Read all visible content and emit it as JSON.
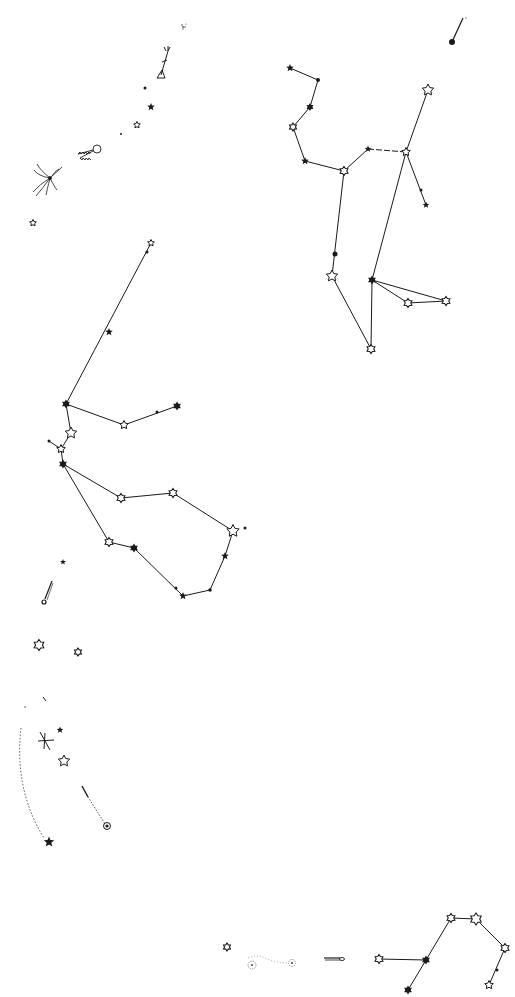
{
  "diagram": {
    "type": "star-chart",
    "background": "#ffffff",
    "ink": "#1a1a1a",
    "width": 515,
    "height": 997
  },
  "stars": [
    {
      "id": "s1",
      "x": 452,
      "y": 42,
      "kind": "dot",
      "r": 3
    },
    {
      "id": "s2",
      "x": 290,
      "y": 68,
      "kind": "star-filled",
      "r": 4
    },
    {
      "id": "s3",
      "x": 318,
      "y": 80,
      "kind": "dot",
      "r": 2
    },
    {
      "id": "s4",
      "x": 310,
      "y": 107,
      "kind": "hex-filled",
      "r": 4
    },
    {
      "id": "s5",
      "x": 293,
      "y": 127,
      "kind": "hex-open",
      "r": 4
    },
    {
      "id": "s6",
      "x": 305,
      "y": 161,
      "kind": "star-filled",
      "r": 4
    },
    {
      "id": "s7",
      "x": 344,
      "y": 171,
      "kind": "hex-open",
      "r": 4.5
    },
    {
      "id": "s8",
      "x": 368,
      "y": 149,
      "kind": "star-filled",
      "r": 3.5
    },
    {
      "id": "s9",
      "x": 406,
      "y": 152,
      "kind": "star-open",
      "r": 4.5
    },
    {
      "id": "s10",
      "x": 428,
      "y": 90,
      "kind": "star-open",
      "r": 6
    },
    {
      "id": "s11",
      "x": 421,
      "y": 190,
      "kind": "dot",
      "r": 1.5
    },
    {
      "id": "s12",
      "x": 426,
      "y": 205,
      "kind": "star-filled",
      "r": 3.5
    },
    {
      "id": "s13",
      "x": 335,
      "y": 254,
      "kind": "dot",
      "r": 2.5
    },
    {
      "id": "s14",
      "x": 332,
      "y": 276,
      "kind": "star-open",
      "r": 6
    },
    {
      "id": "s15",
      "x": 372,
      "y": 280,
      "kind": "hex-filled",
      "r": 4.5
    },
    {
      "id": "s16",
      "x": 408,
      "y": 303,
      "kind": "hex-open",
      "r": 4.5
    },
    {
      "id": "s17",
      "x": 446,
      "y": 301,
      "kind": "hex-open",
      "r": 4.5
    },
    {
      "id": "s18",
      "x": 371,
      "y": 349,
      "kind": "hex-open",
      "r": 4.5
    },
    {
      "id": "s19",
      "x": 151,
      "y": 243,
      "kind": "star-open",
      "r": 3.5
    },
    {
      "id": "s20",
      "x": 147,
      "y": 252,
      "kind": "dot",
      "r": 1.5
    },
    {
      "id": "s21",
      "x": 109,
      "y": 332,
      "kind": "star-filled",
      "r": 4
    },
    {
      "id": "s22",
      "x": 66,
      "y": 404,
      "kind": "hex-filled",
      "r": 4.5
    },
    {
      "id": "s23",
      "x": 124,
      "y": 425,
      "kind": "star-open",
      "r": 4.5
    },
    {
      "id": "s24",
      "x": 157,
      "y": 412,
      "kind": "dot",
      "r": 1.5
    },
    {
      "id": "s25",
      "x": 177,
      "y": 406,
      "kind": "hex-filled",
      "r": 4.5
    },
    {
      "id": "s26",
      "x": 71,
      "y": 433,
      "kind": "star-open",
      "r": 6
    },
    {
      "id": "s27",
      "x": 49,
      "y": 441,
      "kind": "dot",
      "r": 1.5
    },
    {
      "id": "s28",
      "x": 61,
      "y": 449,
      "kind": "star-open",
      "r": 4.5
    },
    {
      "id": "s29",
      "x": 63,
      "y": 464,
      "kind": "hex-filled",
      "r": 4.5
    },
    {
      "id": "s30",
      "x": 121,
      "y": 498,
      "kind": "hex-open",
      "r": 4.5
    },
    {
      "id": "s31",
      "x": 173,
      "y": 493,
      "kind": "hex-open",
      "r": 4.5
    },
    {
      "id": "s32",
      "x": 233,
      "y": 531,
      "kind": "star-open",
      "r": 6.5
    },
    {
      "id": "s33",
      "x": 245,
      "y": 528,
      "kind": "dot",
      "r": 1.5
    },
    {
      "id": "s34",
      "x": 225,
      "y": 556,
      "kind": "star-filled",
      "r": 4
    },
    {
      "id": "s35",
      "x": 210,
      "y": 590,
      "kind": "dot",
      "r": 1.8
    },
    {
      "id": "s36",
      "x": 183,
      "y": 596,
      "kind": "star-filled",
      "r": 4
    },
    {
      "id": "s37",
      "x": 176,
      "y": 588,
      "kind": "dot",
      "r": 1.5
    },
    {
      "id": "s38",
      "x": 134,
      "y": 548,
      "kind": "hex-filled",
      "r": 4.5
    },
    {
      "id": "s39",
      "x": 109,
      "y": 542,
      "kind": "hex-open",
      "r": 4.5
    },
    {
      "id": "s40",
      "x": 63,
      "y": 562,
      "kind": "star-filled",
      "r": 3
    },
    {
      "id": "s41",
      "x": 183,
      "y": 27,
      "kind": "cluster",
      "r": 3
    },
    {
      "id": "s42",
      "x": 145,
      "y": 88,
      "kind": "dot",
      "r": 1.5
    },
    {
      "id": "s43",
      "x": 151,
      "y": 107,
      "kind": "star-filled",
      "r": 4
    },
    {
      "id": "s44",
      "x": 137,
      "y": 125,
      "kind": "star-open",
      "r": 3.5
    },
    {
      "id": "s45",
      "x": 121,
      "y": 134,
      "kind": "dot",
      "r": 1
    },
    {
      "id": "s46",
      "x": 33,
      "y": 223,
      "kind": "star-open",
      "r": 3.5
    },
    {
      "id": "s47",
      "x": 39,
      "y": 645,
      "kind": "hex-open",
      "r": 5.5
    },
    {
      "id": "s48",
      "x": 78,
      "y": 652,
      "kind": "hex-open",
      "r": 4
    },
    {
      "id": "s49",
      "x": 60,
      "y": 730,
      "kind": "star-filled",
      "r": 3.5
    },
    {
      "id": "s50",
      "x": 64,
      "y": 761,
      "kind": "star-open",
      "r": 6
    },
    {
      "id": "s51",
      "x": 49,
      "y": 842,
      "kind": "star-filled",
      "r": 5.5
    },
    {
      "id": "s52",
      "x": 107,
      "y": 826,
      "kind": "spiral",
      "r": 3.5
    },
    {
      "id": "s53",
      "x": 227,
      "y": 947,
      "kind": "hex-open",
      "r": 4
    },
    {
      "id": "s54",
      "x": 252,
      "y": 965,
      "kind": "nebula",
      "r": 4
    },
    {
      "id": "s55",
      "x": 292,
      "y": 963,
      "kind": "nebula",
      "r": 3.5
    },
    {
      "id": "s56",
      "x": 379,
      "y": 959,
      "kind": "hex-open",
      "r": 4.5
    },
    {
      "id": "s57",
      "x": 426,
      "y": 960,
      "kind": "hex-filled",
      "r": 4.5
    },
    {
      "id": "s58",
      "x": 408,
      "y": 990,
      "kind": "hex-filled",
      "r": 4.5
    },
    {
      "id": "s59",
      "x": 451,
      "y": 918,
      "kind": "hex-open",
      "r": 4.5
    },
    {
      "id": "s60",
      "x": 476,
      "y": 919,
      "kind": "hex-open",
      "r": 6
    },
    {
      "id": "s61",
      "x": 505,
      "y": 948,
      "kind": "hex-open",
      "r": 4.5
    },
    {
      "id": "s62",
      "x": 489,
      "y": 985,
      "kind": "star-open",
      "r": 4.5
    },
    {
      "id": "s63",
      "x": 497,
      "y": 970,
      "kind": "dot",
      "r": 1.5
    }
  ],
  "lines": [
    {
      "from": "s2",
      "to": "s3"
    },
    {
      "from": "s3",
      "to": "s4"
    },
    {
      "from": "s4",
      "to": "s5"
    },
    {
      "from": "s5",
      "to": "s6"
    },
    {
      "from": "s6",
      "to": "s7"
    },
    {
      "from": "s7",
      "to": "s8"
    },
    {
      "from": "s8",
      "to": "s9",
      "dashed": true
    },
    {
      "from": "s9",
      "to": "s10"
    },
    {
      "from": "s9",
      "to": "s12"
    },
    {
      "from": "s9",
      "to": "s15"
    },
    {
      "from": "s7",
      "to": "s14"
    },
    {
      "from": "s14",
      "to": "s18"
    },
    {
      "from": "s15",
      "to": "s18"
    },
    {
      "from": "s15",
      "to": "s16"
    },
    {
      "from": "s15",
      "to": "s17"
    },
    {
      "from": "s16",
      "to": "s17"
    },
    {
      "from": "s19",
      "to": "s22"
    },
    {
      "from": "s22",
      "to": "s23"
    },
    {
      "from": "s23",
      "to": "s25"
    },
    {
      "from": "s22",
      "to": "s26"
    },
    {
      "from": "s26",
      "to": "s28"
    },
    {
      "from": "s27",
      "to": "s28"
    },
    {
      "from": "s28",
      "to": "s29"
    },
    {
      "from": "s29",
      "to": "s30"
    },
    {
      "from": "s30",
      "to": "s31"
    },
    {
      "from": "s31",
      "to": "s32"
    },
    {
      "from": "s32",
      "to": "s34"
    },
    {
      "from": "s34",
      "to": "s35"
    },
    {
      "from": "s35",
      "to": "s36"
    },
    {
      "from": "s36",
      "to": "s38"
    },
    {
      "from": "s38",
      "to": "s39"
    },
    {
      "from": "s39",
      "to": "s29"
    },
    {
      "from": "s56",
      "to": "s57"
    },
    {
      "from": "s57",
      "to": "s58"
    },
    {
      "from": "s57",
      "to": "s59"
    },
    {
      "from": "s59",
      "to": "s60"
    },
    {
      "from": "s60",
      "to": "s61"
    },
    {
      "from": "s61",
      "to": "s62"
    }
  ],
  "drawings": [
    {
      "name": "comet-top-right",
      "kind": "comet-streak",
      "x1": 452,
      "y1": 42,
      "x2": 464,
      "y2": 18
    },
    {
      "name": "arrow-figure",
      "kind": "arrow-glyph",
      "x": 162,
      "y": 65
    },
    {
      "name": "caterpillar-comet",
      "kind": "fuzzy-comet",
      "x": 95,
      "y": 150
    },
    {
      "name": "feathered-comet",
      "kind": "tail-comet",
      "x": 50,
      "y": 178
    },
    {
      "name": "comet-left-middle",
      "kind": "comet-streak",
      "x1": 44,
      "y1": 602,
      "x2": 52,
      "y2": 582
    },
    {
      "name": "dotted-trail-left",
      "kind": "dotted-curve",
      "x": 20,
      "y": 730
    },
    {
      "name": "cross-mark",
      "kind": "cross",
      "x": 45,
      "y": 740
    },
    {
      "name": "small-streak",
      "kind": "tick",
      "x": 44,
      "y": 699
    },
    {
      "name": "comet-lower-middle",
      "kind": "comet-streak",
      "x1": 83,
      "y1": 786,
      "x2": 96,
      "y2": 810
    },
    {
      "name": "nebula-trail",
      "kind": "dotted-curve",
      "x": 270,
      "y": 960
    },
    {
      "name": "horizontal-comet",
      "kind": "horizontal-streak",
      "x": 333,
      "y": 958
    }
  ]
}
